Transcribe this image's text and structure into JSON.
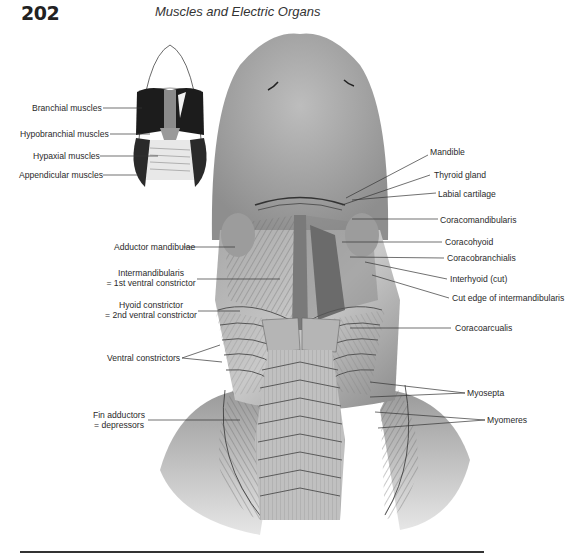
{
  "header": {
    "page_number": "202",
    "running_head": "Muscles and Electric Organs"
  },
  "inset": {
    "labels": [
      "Branchial muscles",
      "Hypobranchial muscles",
      "Hypaxial muscles",
      "Appendicular muscles"
    ]
  },
  "figure": {
    "left_labels": {
      "adductor_mandibulae": "Adductor mandibulae",
      "intermandibularis_1": "Intermandibularis",
      "intermandibularis_2": "= 1st ventral constrictor",
      "hyoid_1": "Hyoid constrictor",
      "hyoid_2": "= 2nd ventral constrictor",
      "ventral_constrictors": "Ventral constrictors",
      "fin_adductors_1": "Fin adductors",
      "fin_adductors_2": "= depressors"
    },
    "right_labels": {
      "mandible": "Mandible",
      "thyroid_gland": "Thyroid gland",
      "labial_cartilage": "Labial cartilage",
      "coracomandibularis": "Coracomandibularis",
      "coracohyoid": "Coracohyoid",
      "coracobranchialis": "Coracobranchialis",
      "interhyoid": "Interhyoid (cut)",
      "cut_edge": "Cut edge of intermandibularis",
      "coracoarcualis": "Coracoarcualis",
      "myosepta": "Myosepta",
      "myomeres": "Myomeres"
    }
  }
}
